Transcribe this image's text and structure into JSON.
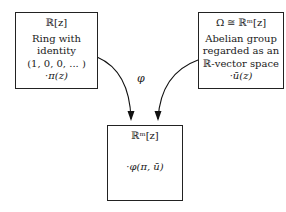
{
  "diagram": {
    "left_box": {
      "title": "ℝ[z]",
      "lines": [
        "Ring with",
        "identity",
        "(1, 0, 0, ... )"
      ],
      "element": "·π(z)"
    },
    "right_box": {
      "title": "Ω ≅ ℝᵐ[z]",
      "lines": [
        "Abelian group",
        "regarded as an",
        "ℝ-vector space"
      ],
      "element": "·ū(z)"
    },
    "bottom_box": {
      "title": "ℝᵐ[z]",
      "element": "·φ(π, ū)"
    },
    "map_label": "φ",
    "edges": [
      {
        "from": "left_box",
        "to": "bottom_box",
        "label": "φ"
      },
      {
        "from": "right_box",
        "to": "bottom_box",
        "label": "φ"
      }
    ]
  }
}
